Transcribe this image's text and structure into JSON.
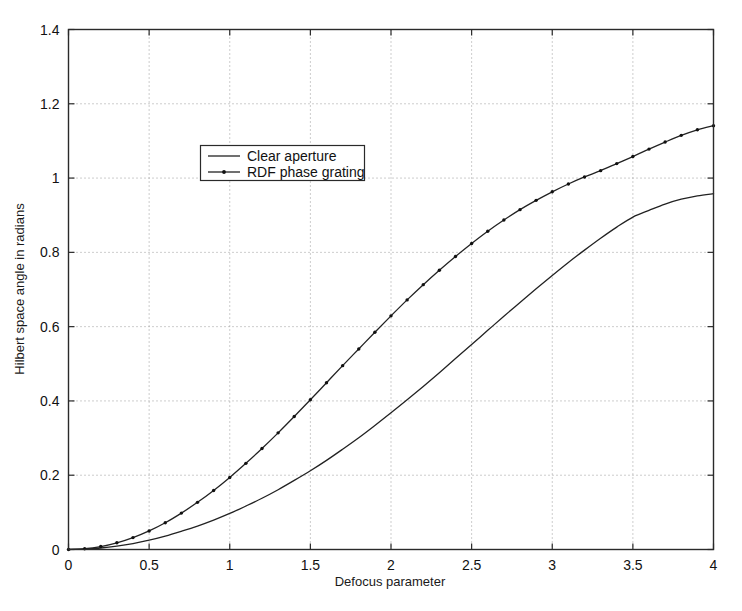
{
  "chart_data": {
    "type": "line",
    "title": "",
    "xlabel": "Defocus parameter",
    "ylabel": "Hilbert space angle in radians",
    "xlim": [
      0,
      4
    ],
    "ylim": [
      0,
      1.4
    ],
    "xticks": [
      "0",
      "0.5",
      "1",
      "1.5",
      "2",
      "2.5",
      "3",
      "3.5",
      "4"
    ],
    "xtick_values": [
      0,
      0.5,
      1,
      1.5,
      2,
      2.5,
      3,
      3.5,
      4
    ],
    "yticks": [
      "0",
      "0.2",
      "0.4",
      "0.6",
      "0.8",
      "1",
      "1.2",
      "1.4"
    ],
    "ytick_values": [
      0,
      0.2,
      0.4,
      0.6,
      0.8,
      1.0,
      1.2,
      1.4
    ],
    "grid": true,
    "grid_style": "dotted",
    "legend_position": "upper-left-inside",
    "x": [
      0,
      0.1,
      0.2,
      0.3,
      0.4,
      0.5,
      0.6,
      0.7,
      0.8,
      0.9,
      1.0,
      1.1,
      1.2,
      1.3,
      1.4,
      1.5,
      1.6,
      1.7,
      1.8,
      1.9,
      2.0,
      2.1,
      2.2,
      2.3,
      2.4,
      2.5,
      2.6,
      2.7,
      2.8,
      2.9,
      3.0,
      3.1,
      3.2,
      3.3,
      3.4,
      3.5,
      3.6,
      3.7,
      3.8,
      3.9,
      4.0
    ],
    "series": [
      {
        "name": "Clear aperture",
        "marker": "none",
        "line_style": "solid",
        "color": "#222222",
        "values": [
          0.0,
          0.001,
          0.004,
          0.009,
          0.016,
          0.025,
          0.036,
          0.049,
          0.063,
          0.079,
          0.097,
          0.117,
          0.138,
          0.161,
          0.186,
          0.212,
          0.24,
          0.27,
          0.301,
          0.334,
          0.368,
          0.403,
          0.439,
          0.476,
          0.514,
          0.552,
          0.59,
          0.628,
          0.665,
          0.702,
          0.738,
          0.773,
          0.806,
          0.838,
          0.868,
          0.895,
          0.913,
          0.93,
          0.943,
          0.952,
          0.958
        ]
      },
      {
        "name": "RDF phase grating",
        "marker": "dot",
        "line_style": "solid",
        "color": "#222222",
        "values": [
          0.0,
          0.002,
          0.008,
          0.018,
          0.032,
          0.05,
          0.072,
          0.098,
          0.127,
          0.159,
          0.194,
          0.232,
          0.272,
          0.314,
          0.358,
          0.403,
          0.449,
          0.495,
          0.54,
          0.585,
          0.629,
          0.672,
          0.713,
          0.752,
          0.789,
          0.824,
          0.857,
          0.887,
          0.915,
          0.94,
          0.963,
          0.984,
          1.003,
          1.02,
          1.039,
          1.058,
          1.078,
          1.097,
          1.115,
          1.13,
          1.141
        ]
      }
    ],
    "legend": [
      {
        "label": "Clear aperture",
        "marker": "none"
      },
      {
        "label": "RDF phase grating",
        "marker": "dot"
      }
    ]
  },
  "axes": {
    "x_title": "Defocus parameter",
    "y_title": "Hilbert space angle in radians"
  },
  "xtick_labels": [
    "0",
    "0.5",
    "1",
    "1.5",
    "2",
    "2.5",
    "3",
    "3.5",
    "4"
  ],
  "ytick_labels": [
    "0",
    "0.2",
    "0.4",
    "0.6",
    "0.8",
    "1",
    "1.2",
    "1.4"
  ],
  "legend_labels": [
    "Clear aperture",
    "RDF phase grating"
  ],
  "colors": {
    "line": "#222222",
    "frame": "#2a2a2a",
    "grid": "#9a9a9a",
    "background": "#ffffff"
  }
}
